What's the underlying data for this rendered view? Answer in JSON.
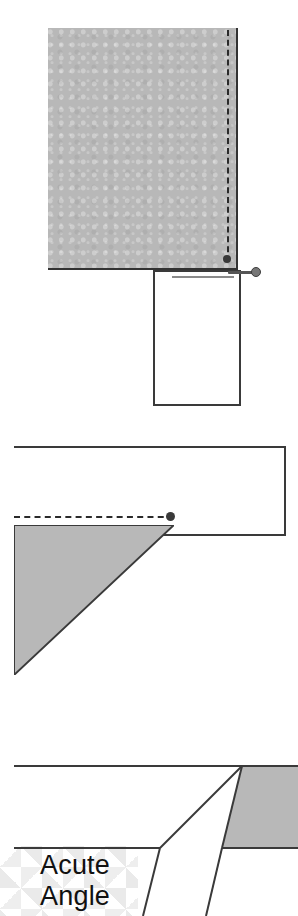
{
  "figure": {
    "background_color": "#ffffff",
    "fabric_color": "#b8b8b8",
    "line_color": "#3a3a3a",
    "seam_color": "#2a2a2a"
  },
  "panels": [
    {
      "id": "panel-top",
      "name": "pinned-seam-corner",
      "elements": {
        "fabric_piece": "gray fabric rectangle",
        "seam_line": "dashed stitching line",
        "seam_endpoint": "seam end dot",
        "lower_piece": "white fabric rectangle",
        "fold_line": "fold edge",
        "pin": "straight pin"
      }
    },
    {
      "id": "panel-mid",
      "name": "folded-corner-seam",
      "elements": {
        "strip": "white fabric strip",
        "seam_line": "dashed stitching line",
        "seam_endpoint": "seam end dot",
        "triangle": "gray folded triangle"
      }
    },
    {
      "id": "panel-bot",
      "name": "acute-angle-detail",
      "elements": {
        "upper_band": "white fabric band",
        "gray_piece": "gray fabric piece",
        "point": "acute point apex",
        "pattern": "argyle background pattern"
      }
    }
  ],
  "labels": {
    "acute_angle_line1": "Acute",
    "acute_angle_line2": "Angle"
  }
}
